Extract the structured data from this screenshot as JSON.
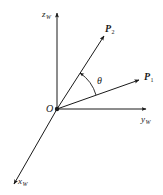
{
  "diagram": {
    "type": "3d-coordinate-system",
    "colors": {
      "line": "#1a1a1a",
      "background": "#ffffff"
    },
    "origin": {
      "label": "O",
      "pos": [
        57,
        109
      ]
    },
    "axes": [
      {
        "id": "z",
        "label": "z",
        "subscript": "W",
        "tip": [
          57,
          12
        ]
      },
      {
        "id": "y",
        "label": "y",
        "subscript": "W",
        "tip": [
          147,
          109
        ]
      },
      {
        "id": "x",
        "label": "x",
        "subscript": "W",
        "tip": [
          13,
          185
        ]
      }
    ],
    "vectors": [
      {
        "id": "P2",
        "label": "P",
        "subscript": "2",
        "tip": [
          105,
          35
        ]
      },
      {
        "id": "P1",
        "label": "P",
        "subscript": "1",
        "tip": [
          140,
          80
        ]
      }
    ],
    "angle": {
      "label": "θ",
      "between": [
        "P1",
        "P2"
      ]
    }
  }
}
